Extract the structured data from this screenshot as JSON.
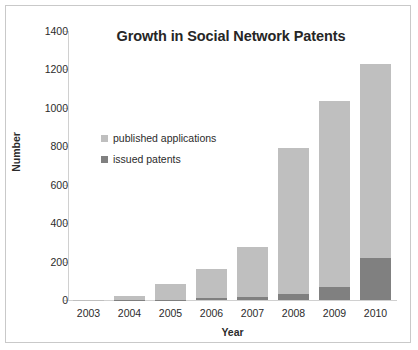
{
  "chart_data": {
    "type": "bar",
    "stacked": true,
    "title": "Growth in Social Network Patents",
    "xlabel": "Year",
    "ylabel": "Number",
    "categories": [
      "2003",
      "2004",
      "2005",
      "2006",
      "2007",
      "2008",
      "2009",
      "2010"
    ],
    "series": [
      {
        "name": "issued patents",
        "color": "#808080",
        "values": [
          0,
          1,
          2,
          10,
          17,
          33,
          70,
          220
        ]
      },
      {
        "name": "published applications",
        "color": "#bfbfbf",
        "values": [
          2,
          21,
          80,
          153,
          261,
          757,
          965,
          1010
        ]
      }
    ],
    "totals": [
      2,
      22,
      82,
      163,
      278,
      790,
      1035,
      1230
    ],
    "ylim": [
      0,
      1400
    ],
    "yticks": [
      0,
      200,
      400,
      600,
      800,
      1000,
      1200,
      1400
    ],
    "ytick_labels": [
      "0",
      "200",
      "400",
      "600",
      "800",
      "1000",
      "1200",
      "1400"
    ],
    "grid": false,
    "legend_position": "inside-upper-left",
    "legend": [
      {
        "label": "published applications",
        "color": "#bfbfbf"
      },
      {
        "label": "issued patents",
        "color": "#808080"
      }
    ]
  },
  "colors": {
    "published": "#bfbfbf",
    "issued": "#808080",
    "axis": "#d0d0d0",
    "text": "#2b2b2b",
    "border": "#c9c9c9",
    "background": "#ffffff"
  }
}
